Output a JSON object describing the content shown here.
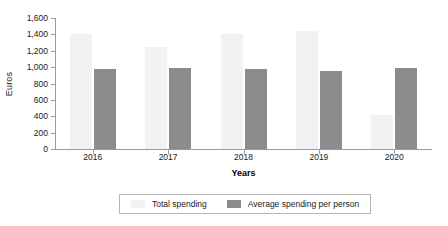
{
  "chart_data": {
    "type": "bar",
    "title": "",
    "subtitle": "",
    "xlabel": "Years",
    "ylabel": "Euros",
    "categories": [
      "2016",
      "2017",
      "2018",
      "2019",
      "2020"
    ],
    "series": [
      {
        "name": "Total spending",
        "color": "#f2f2f2",
        "values": [
          1410,
          1250,
          1410,
          1440,
          420
        ]
      },
      {
        "name": "Average spending per person",
        "color": "#8c8c8c",
        "values": [
          980,
          985,
          980,
          955,
          985
        ]
      }
    ],
    "ylim": [
      0,
      1600
    ],
    "ytick_labels": [
      "0",
      "200",
      "400",
      "600",
      "800",
      "1,000",
      "1,200",
      "1,400",
      "1,600"
    ],
    "ytick_values": [
      0,
      200,
      400,
      600,
      800,
      1000,
      1200,
      1400,
      1600
    ],
    "grid": false,
    "legend_position": "bottom",
    "background_color": "#ffffff",
    "axis_color": "#9a9a9a"
  }
}
